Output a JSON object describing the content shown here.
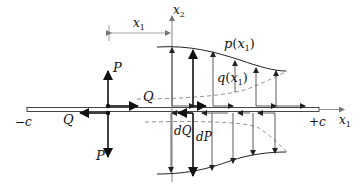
{
  "diagram": {
    "axes": {
      "x1_label": "x",
      "x1_sub": "1",
      "x2_label": "x",
      "x2_sub": "2"
    },
    "dimension": {
      "label": "x",
      "sub": "1"
    },
    "crack_ends": {
      "left": "−c",
      "right": "+c"
    },
    "point_forces": {
      "p_upper": "P",
      "p_lower": "P",
      "q_upper": "Q",
      "q_lower": "Q"
    },
    "distributed": {
      "normal": "p(x₁)",
      "normal_name": "p",
      "normal_arg": "x",
      "normal_arg_sub": "1",
      "shear_name": "q",
      "shear_arg": "x",
      "shear_arg_sub": "1"
    },
    "differentials": {
      "dQ": "dQ",
      "dP": "dP"
    }
  }
}
